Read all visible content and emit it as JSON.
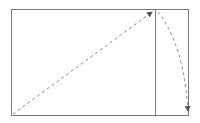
{
  "diagram": {
    "colors": {
      "frame": "#7a7a7a",
      "arrow": "#8a8a8a",
      "background": "#ffffff"
    },
    "frame": {
      "x": 11.5,
      "y": 9.5,
      "width": 177,
      "height": 106
    },
    "divider": {
      "x": 155.5,
      "y1": 9.5,
      "y2": 115.5
    },
    "diagonal_arrow": {
      "from": [
        12,
        114
      ],
      "to": [
        152,
        12
      ],
      "style": "dashed"
    },
    "curved_arrow": {
      "from": [
        158,
        12
      ],
      "control": [
        185,
        40
      ],
      "to": [
        188,
        111
      ],
      "style": "dashed"
    }
  }
}
